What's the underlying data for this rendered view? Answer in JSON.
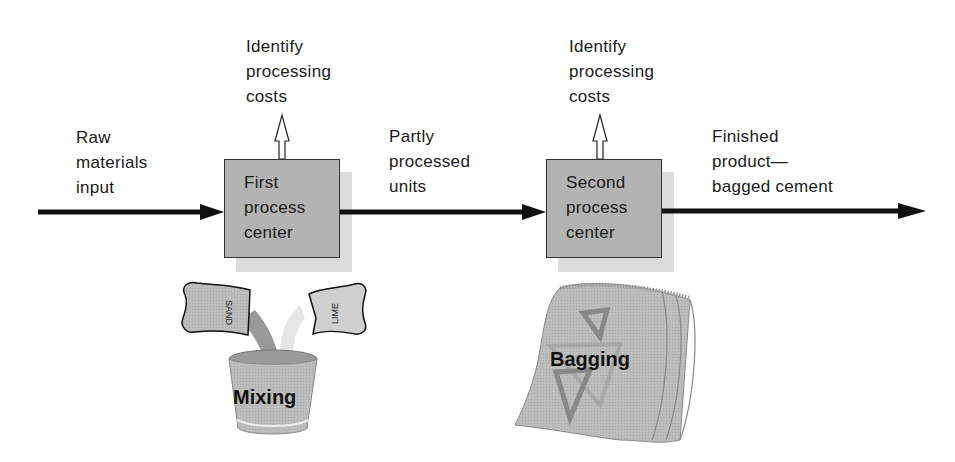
{
  "diagram": {
    "type": "process-flow",
    "input": {
      "label": "Raw\nmaterials\ninput"
    },
    "processes": [
      {
        "label": "First\nprocess\ncenter",
        "output_note": "Identify\nprocessing\ncosts",
        "illustration": {
          "label": "Mixing",
          "bags": [
            "SAND",
            "LIME"
          ]
        }
      },
      {
        "label": "Second\nprocess\ncenter",
        "output_note": "Identify\nprocessing\ncosts",
        "illustration": {
          "label": "Bagging"
        }
      }
    ],
    "intermediate": {
      "label": "Partly\nprocessed\nunits"
    },
    "output": {
      "label": "Finished\nproduct—\nbagged cement"
    },
    "colors": {
      "box_fill": "#b3b3b3",
      "box_shadow": "#dcdcdc",
      "arrow": "#111111"
    }
  }
}
